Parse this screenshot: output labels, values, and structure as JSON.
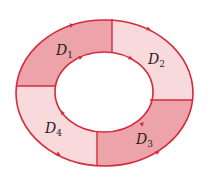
{
  "diagram": {
    "type": "annular region divided into four subregions with oriented boundary",
    "colors": {
      "stroke": "#d42a3a",
      "dark_fill": "#eda3aa",
      "light_fill": "#f8d9dc",
      "background": "#ffffff",
      "text": "#2a1a1c"
    },
    "regions": [
      {
        "id": "D1",
        "base": "D",
        "sub": "1",
        "position": "top-left",
        "shade": "dark"
      },
      {
        "id": "D2",
        "base": "D",
        "sub": "2",
        "position": "top-right",
        "shade": "light"
      },
      {
        "id": "D3",
        "base": "D",
        "sub": "3",
        "position": "bottom-right",
        "shade": "dark"
      },
      {
        "id": "D4",
        "base": "D",
        "sub": "4",
        "position": "bottom-left",
        "shade": "light"
      }
    ],
    "orientation": {
      "outer_boundary": "counterclockwise arrows (direction markers on outer ellipse)",
      "inner_boundary": "clockwise arrows (direction markers on inner ellipse)"
    }
  }
}
